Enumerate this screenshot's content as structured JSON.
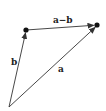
{
  "diagram": {
    "title": "",
    "type": "vector-subtraction",
    "colors": {
      "line": "#333333",
      "point": "#111111",
      "label": "#222222",
      "background": "#ffffff"
    },
    "points": {
      "origin": {
        "x": 9,
        "y": 107
      },
      "b_tip": {
        "x": 26,
        "y": 30
      },
      "a_tip": {
        "x": 97,
        "y": 25
      }
    },
    "vectors": [
      {
        "name": "b",
        "from": "origin",
        "to": "b_tip",
        "label": "b"
      },
      {
        "name": "a",
        "from": "origin",
        "to": "a_tip",
        "label": "a"
      },
      {
        "name": "a-b",
        "from": "b_tip",
        "to": "a_tip",
        "label": "a−b"
      }
    ],
    "labels": {
      "a_minus_b": "a−b",
      "b": "b",
      "a": "a"
    }
  }
}
